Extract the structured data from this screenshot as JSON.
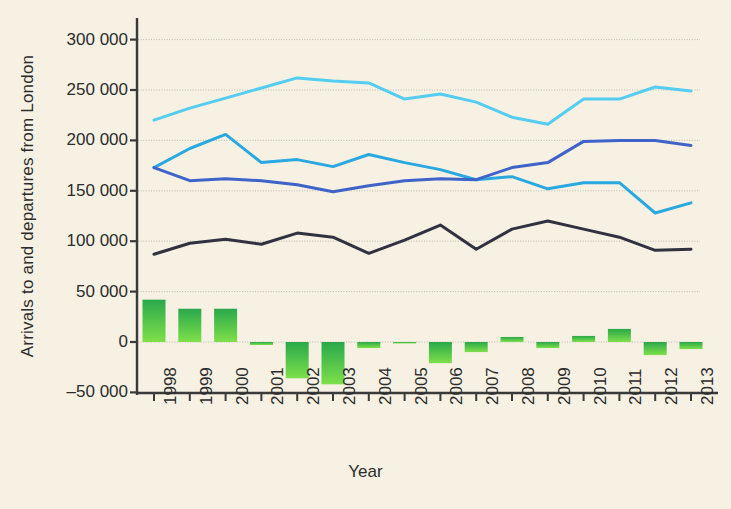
{
  "chart_data": {
    "type": "bar",
    "title": "",
    "xlabel": "Year",
    "ylabel": "Arrivals to and departures from London",
    "categories": [
      "1998",
      "1999",
      "2000",
      "2001",
      "2002",
      "2003",
      "2004",
      "2005",
      "2006",
      "2007",
      "2008",
      "2009",
      "2010",
      "2011",
      "2012",
      "2013"
    ],
    "ylim": [
      -50000,
      300000
    ],
    "ytick_labels": [
      "300 000",
      "250 000",
      "200 000",
      "150 000",
      "100 000",
      "50 000",
      "0",
      "–50 000"
    ],
    "ytick_values": [
      300000,
      250000,
      200000,
      150000,
      100000,
      50000,
      0,
      -50000
    ],
    "grid": true,
    "legend_position": "none",
    "series": [
      {
        "name": "light-cyan-line",
        "kind": "line",
        "color": "#54cdf0",
        "values": [
          220000,
          232000,
          242000,
          252000,
          262000,
          259000,
          257000,
          241000,
          246000,
          238000,
          223000,
          216000,
          241000,
          241000,
          253000,
          249000
        ]
      },
      {
        "name": "medium-blue-line",
        "kind": "line",
        "color": "#2aa8e0",
        "values": [
          173000,
          192000,
          206000,
          178000,
          181000,
          174000,
          186000,
          178000,
          171000,
          161000,
          164000,
          152000,
          158000,
          158000,
          128000,
          138000
        ]
      },
      {
        "name": "royal-blue-line",
        "kind": "line",
        "color": "#3f63c8",
        "values": [
          173000,
          160000,
          162000,
          160000,
          156000,
          149000,
          155000,
          160000,
          162000,
          161000,
          173000,
          178000,
          199000,
          200000,
          200000,
          195000
        ]
      },
      {
        "name": "dark-navy-line",
        "kind": "line",
        "color": "#31313f",
        "values": [
          87000,
          98000,
          102000,
          97000,
          108000,
          104000,
          88000,
          101000,
          116000,
          92000,
          112000,
          120000,
          112000,
          104000,
          91000,
          92000
        ]
      },
      {
        "name": "net-balance-bars",
        "kind": "bar",
        "color_top": "#29a84a",
        "color_bottom": "#7ee04a",
        "values": [
          42000,
          33000,
          33000,
          -3000,
          -36000,
          -42000,
          -6000,
          -1000,
          -21000,
          -10000,
          5000,
          -6000,
          6000,
          13000,
          -13000,
          -7000
        ]
      }
    ]
  },
  "plot": {
    "left": 137,
    "right": 700,
    "top": 18,
    "bottom": 393,
    "y_zero_px": 342,
    "px_per_50k": 50.4,
    "x_first": 154,
    "x_step": 35.8,
    "bar_width": 23
  },
  "colors": {
    "background": "#f6f1e3",
    "axis": "#3a3a3a",
    "grid": "#b9b4a6",
    "text": "#2c2c2c"
  }
}
